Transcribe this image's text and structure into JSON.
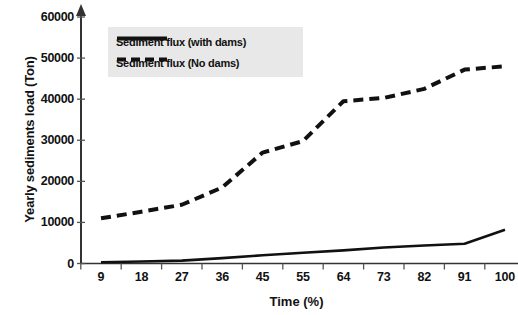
{
  "chart_data": {
    "type": "line",
    "title": "",
    "xlabel": "Time (%)",
    "ylabel": "Yearly sediments load (Ton)",
    "categories": [
      "9",
      "18",
      "27",
      "36",
      "45",
      "55",
      "64",
      "73",
      "82",
      "91",
      "100"
    ],
    "ylim": [
      0,
      60000
    ],
    "yticks": [
      0,
      10000,
      20000,
      30000,
      40000,
      50000,
      60000
    ],
    "ytick_labels": [
      "0",
      "10000",
      "20000",
      "30000",
      "40000",
      "50000",
      "60000"
    ],
    "grid": false,
    "legend_position": "top-left",
    "series": [
      {
        "name": "Sediment flux (with dams)",
        "style": "solid",
        "color": "#111111",
        "values": [
          300,
          500,
          700,
          1300,
          2000,
          2600,
          3200,
          3900,
          4400,
          4800,
          8200
        ]
      },
      {
        "name": "Sediment flux (No dams)",
        "style": "dashed",
        "color": "#111111",
        "values": [
          11000,
          12600,
          14300,
          18500,
          27000,
          29800,
          39500,
          40300,
          42500,
          47200,
          48000
        ]
      }
    ]
  }
}
